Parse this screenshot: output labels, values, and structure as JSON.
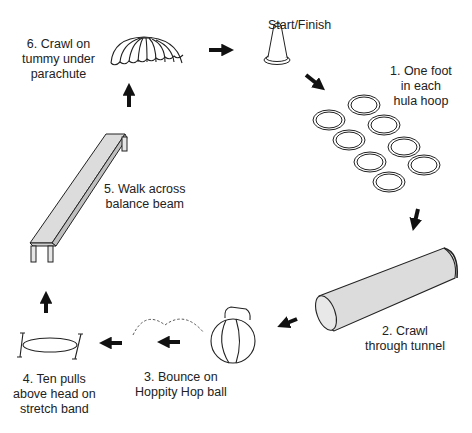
{
  "stations": {
    "start": {
      "lines": [
        "Start/Finish"
      ]
    },
    "s1": {
      "lines": [
        "1. One foot",
        "in each",
        "hula hoop"
      ]
    },
    "s2": {
      "lines": [
        "2. Crawl",
        "through tunnel"
      ]
    },
    "s3": {
      "lines": [
        "3. Bounce on",
        "Hoppity Hop ball"
      ]
    },
    "s4": {
      "lines": [
        "4. Ten pulls",
        "above head on",
        "stretch band"
      ]
    },
    "s5": {
      "lines": [
        "5. Walk across",
        "balance beam"
      ]
    },
    "s6": {
      "lines": [
        "6. Crawl on",
        "tummy under",
        "parachute"
      ]
    }
  },
  "icons": [
    "parachute-icon",
    "cone-icon",
    "hula-hoops-icon",
    "tunnel-icon",
    "hoppity-ball-icon",
    "stretch-band-icon",
    "balance-beam-icon"
  ],
  "hula_hoop_count": 8,
  "colors": {
    "stroke": "#222222",
    "fill_gray": "#d9d9d9",
    "arrow": "#111111",
    "background": "#ffffff"
  }
}
